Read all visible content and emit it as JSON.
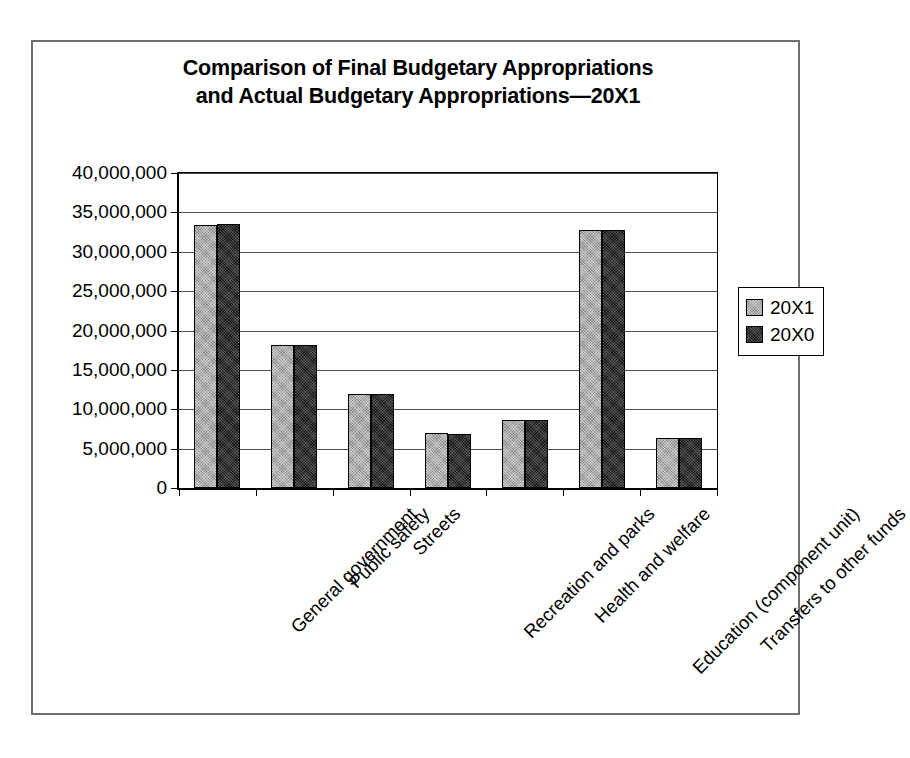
{
  "chart_data": {
    "type": "bar",
    "title": "Comparison of Final Budgetary Appropriations and Actual Budgetary Appropriations—20X1",
    "title_lines": [
      "Comparison of Final Budgetary Appropriations",
      "and Actual Budgetary Appropriations—20X1"
    ],
    "xlabel": "",
    "ylabel": "",
    "ylim": [
      0,
      40000000
    ],
    "ytick_step": 5000000,
    "grid": true,
    "legend_position": "right",
    "categories": [
      "General government",
      "Public safety",
      "Streets",
      "Recreation and parks",
      "Health and welfare",
      "Education (component unit)",
      "Transfers to other funds"
    ],
    "ytick_labels": [
      "40,000,000",
      "35,000,000",
      "30,000,000",
      "25,000,000",
      "20,000,000",
      "15,000,000",
      "10,000,000",
      "5,000,000",
      "0"
    ],
    "ytick_values": [
      40000000,
      35000000,
      30000000,
      25000000,
      20000000,
      15000000,
      10000000,
      5000000,
      0
    ],
    "series": [
      {
        "name": "20X1",
        "color": "#8a8a8a",
        "values": [
          33400000,
          18200000,
          11900000,
          7000000,
          8600000,
          32800000,
          6300000
        ]
      },
      {
        "name": "20X0",
        "color": "#151515",
        "values": [
          33500000,
          18200000,
          11900000,
          6900000,
          8600000,
          32800000,
          6300000
        ]
      }
    ],
    "legend_entries": [
      {
        "label": "20X1",
        "color": "#8a8a8a"
      },
      {
        "label": "20X0",
        "color": "#151515"
      }
    ]
  },
  "colors": {
    "frame": "#6f6f6f",
    "axis": "#000000",
    "gridline": "#4f4f4f",
    "series_20x1": "#8a8a8a",
    "series_20x0": "#151515",
    "background": "#ffffff"
  }
}
